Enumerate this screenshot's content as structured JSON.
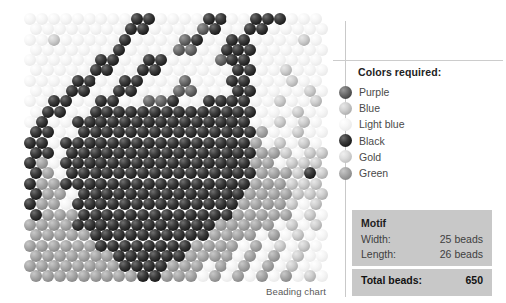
{
  "chart": {
    "caption": "Beading chart",
    "grid": {
      "width_beads": 25,
      "length_beads": 26,
      "bead_diameter_px": 12,
      "row_pitch_px": 10.3,
      "stitch": "brick"
    }
  },
  "legend": {
    "title": "Colors required:",
    "items": [
      {
        "key": "purple",
        "label": "Purple",
        "swatch": "c-purple"
      },
      {
        "key": "blue",
        "label": "Blue",
        "swatch": "c-blue"
      },
      {
        "key": "lightblue",
        "label": "Light blue",
        "swatch": "c-lightblue"
      },
      {
        "key": "black",
        "label": "Black",
        "swatch": "c-black"
      },
      {
        "key": "gold",
        "label": "Gold",
        "swatch": "c-gold"
      },
      {
        "key": "green",
        "label": "Green",
        "swatch": "c-green"
      }
    ]
  },
  "motif": {
    "title": "Motif",
    "width_label": "Width:",
    "width_value": "25 beads",
    "length_label": "Length:",
    "length_value": "26 beads",
    "total_label": "Total beads:",
    "total_value": "650"
  },
  "colors": {
    "purple": "#6e6e6e",
    "blue": "#cfcfcf",
    "lightblue": "#f4f4f4",
    "black": "#262626",
    "gold": "#dcdcdc",
    "green": "#a8a8a8",
    "panel_box_bg": "#c8c8c8",
    "rule": "#c9c9c9"
  },
  "bead_pattern": {
    "palette_keys": [
      "lightblue",
      "blue",
      "gold",
      "green",
      "purple",
      "black"
    ],
    "legend_map": {
      "L": "lightblue",
      "B": "blue",
      "G": "gold",
      "N": "green",
      "P": "purple",
      "K": "black"
    },
    "rows": [
      "LLLLLLLLLKKLLLLKKLLKKKLLL",
      "LLLLLLLLKKLLLLPKLLKKLLLLL",
      "LLBLLLLLKLLLLPKLLKKLLLLBL",
      "LLLLLLLKLLLLPPLLKKKLLLLLL",
      "LLLLLLKKLLKKLLLLPKKLLLLLL",
      "LLLLLKKLLKKLLLLLLKKLLBLLL",
      "LLLLKKLLKKLLLPLLLKKLLLBLL",
      "LLLKKLLKKLLLPPLLLKKLLLLBL",
      "LLKKLLKKLLPPKLLKKKKLLBLLB",
      "LKKLLKKKKKKKKKKKKKKLLLBLL",
      "LKLLKKKKKKKKKKKKKKKLLBLBL",
      "KKLLKKKKKKKKKKKKKKKNLLBLL",
      "KKLKKKKKKKKKKKKKKKKNLBLBL",
      "KKLKKKKKKKKKKKKKKKKNNBLBB",
      "KNLKKKKKKKKKKKKKKKKNNLBBB",
      "KNLKKKKKKKKKKKKKKKKNNNBKB",
      "KNNKKKKKKKKKKKKKKKKNNNBBB",
      "KNNLKKKKKKKKKKKKKKNNNNBBB",
      "KNNLKKKKKKKKKKKKKKNNNNBLB",
      "KNNNKKKKKKKKKKKKKNNNNNLBL",
      "NNNNKKKKKKKKKKKKNNNNNLBLB",
      "NNNNNKKKKKKKKKKNNNNLNLBLL",
      "NNNNNNKKKKKKKKNNNNLNLBLBL",
      "NNNNNNNKKKKKKNNNNLNLNLBLL",
      "NNNNNNNNKKKKNNNLNLNLNLBLL",
      "NNNNNNNNNKKNNNLNLNLNLNLBL"
    ]
  }
}
